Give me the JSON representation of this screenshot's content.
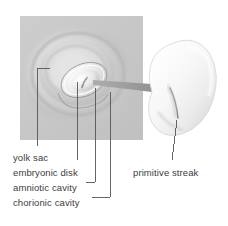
{
  "figure": {
    "title": "",
    "panel": {
      "name": "histology-panel",
      "x": 20,
      "y": 16,
      "width": 123,
      "height": 124,
      "fill": "#c9c9c9",
      "description": "gray square panel showing concentric gestational sac layers"
    },
    "embryo": {
      "name": "embryo-3d",
      "fill": "#f4f4f4",
      "description": "pale bean-shaped embryonic disk with a central groove"
    },
    "arrow": {
      "name": "magnify-arrow",
      "color": "#9a9a9a",
      "from": [
        96,
        80
      ],
      "to": [
        166,
        88
      ]
    }
  },
  "labels": {
    "left": [
      {
        "id": "yolk-sac",
        "text": "yolk sac",
        "x": 13,
        "y": 152
      },
      {
        "id": "embryonic-disk",
        "text": "embryonic disk",
        "x": 13,
        "y": 167
      },
      {
        "id": "amniotic-cavity",
        "text": "amniotic cavity",
        "x": 13,
        "y": 182
      },
      {
        "id": "chorionic-cavity",
        "text": "chorionic cavity",
        "x": 13,
        "y": 197
      }
    ],
    "right": [
      {
        "id": "primitive-streak",
        "text": "primitive streak",
        "x": 133,
        "y": 167
      }
    ]
  },
  "colors": {
    "background": "#ffffff",
    "panel_gray": "#c9c9c9",
    "leader_line": "#55555a",
    "text": "#3d3d3d",
    "arrow_gray": "#9a9a9a",
    "embryo_light": "#fbfbfb",
    "embryo_shadow": "#d8d8d8"
  }
}
